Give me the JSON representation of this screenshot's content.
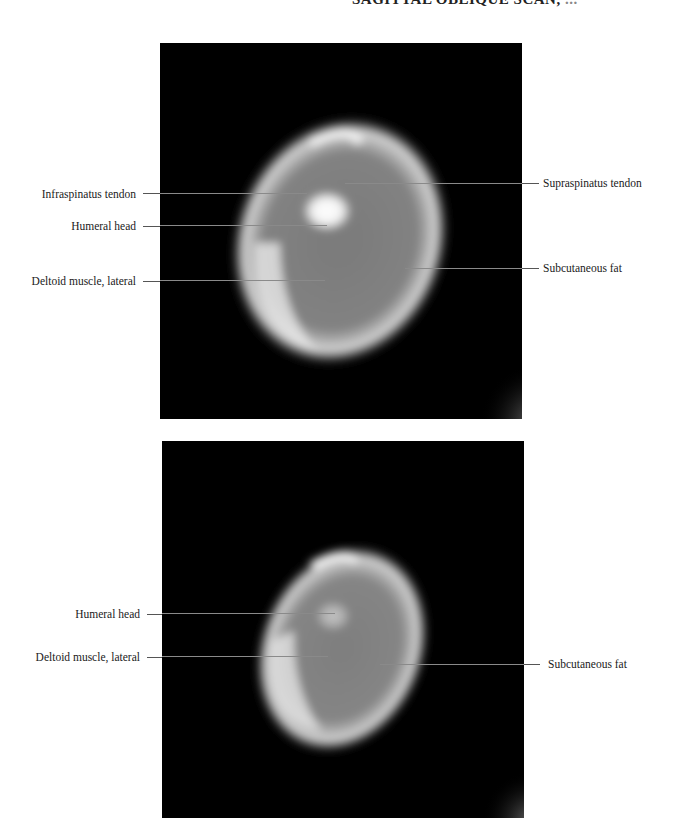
{
  "header": {
    "title": "SAGITTAL OBLIQUE SCAN,",
    "title_tail": " ..."
  },
  "figures": [
    {
      "id": "top",
      "labels_left": [
        {
          "text": "Infraspinatus tendon"
        },
        {
          "text": "Humeral head"
        },
        {
          "text": "Deltoid muscle, lateral"
        }
      ],
      "labels_right": [
        {
          "text": "Supraspinatus tendon"
        },
        {
          "text": "Subcutaneous fat"
        }
      ]
    },
    {
      "id": "bottom",
      "labels_left": [
        {
          "text": "Humeral head"
        },
        {
          "text": "Deltoid muscle, lateral"
        }
      ],
      "labels_right": [
        {
          "text": "Subcutaneous fat"
        }
      ]
    }
  ]
}
